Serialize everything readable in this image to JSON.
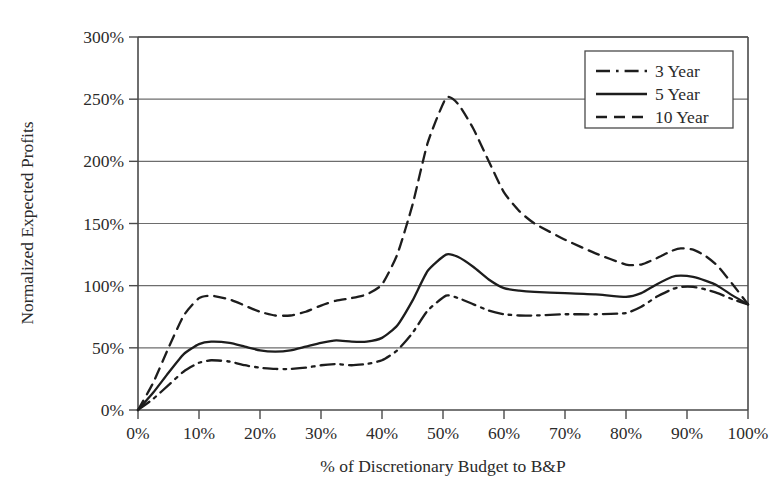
{
  "chart_data": {
    "type": "line",
    "title": "",
    "xlabel": "% of Discretionary Budget to B&P",
    "ylabel": "Normalized Expected Profits",
    "xlim": [
      0,
      100
    ],
    "ylim": [
      0,
      300
    ],
    "grid": true,
    "legend_position": "top-right",
    "x_tick_labels": [
      "0%",
      "10%",
      "20%",
      "30%",
      "40%",
      "50%",
      "60%",
      "70%",
      "80%",
      "90%",
      "100%"
    ],
    "x_tick_values": [
      0,
      10,
      20,
      30,
      40,
      50,
      60,
      70,
      80,
      90,
      100
    ],
    "y_tick_labels": [
      "0%",
      "50%",
      "100%",
      "150%",
      "200%",
      "250%",
      "300%"
    ],
    "y_tick_values": [
      0,
      50,
      100,
      150,
      200,
      250,
      300
    ],
    "x": [
      0,
      2.5,
      5,
      7.5,
      10,
      12,
      15,
      17.5,
      20,
      22.5,
      25,
      27.5,
      30,
      32.5,
      35,
      37.5,
      40,
      42.5,
      45,
      47.5,
      50.5,
      52.5,
      55,
      57.5,
      60,
      62.5,
      65,
      70,
      75,
      80,
      82.5,
      85,
      87.5,
      89,
      91,
      93,
      95,
      97.5,
      100
    ],
    "series": [
      {
        "name": "3 Year",
        "label": "3 Year",
        "line_style": "dash-dot",
        "color": "#1d1d1d",
        "values": [
          0,
          9,
          20,
          31,
          38,
          40,
          39,
          36,
          34,
          33,
          33,
          34,
          36,
          37,
          36,
          37,
          40,
          48,
          62,
          80,
          92,
          90,
          85,
          80,
          77,
          76,
          76,
          77,
          77,
          78,
          83,
          91,
          97,
          99,
          99,
          97,
          94,
          89,
          85
        ]
      },
      {
        "name": "5 Year",
        "label": "5 Year",
        "line_style": "solid",
        "color": "#1d1d1d",
        "values": [
          0,
          14,
          30,
          45,
          53,
          55,
          54,
          51,
          48,
          47,
          48,
          51,
          54,
          56,
          55,
          55,
          58,
          68,
          88,
          112,
          125,
          123,
          115,
          105,
          98,
          96,
          95,
          94,
          93,
          91,
          94,
          101,
          107,
          108,
          107,
          104,
          100,
          92,
          85
        ]
      },
      {
        "name": "10 Year",
        "label": "10 Year",
        "line_style": "dashed",
        "color": "#1d1d1d",
        "values": [
          0,
          22,
          50,
          76,
          90,
          92,
          89,
          84,
          79,
          76,
          76,
          79,
          84,
          88,
          90,
          93,
          101,
          125,
          165,
          215,
          251,
          246,
          226,
          200,
          175,
          160,
          150,
          137,
          126,
          117,
          117,
          122,
          128,
          130,
          129,
          124,
          116,
          101,
          85
        ]
      }
    ]
  }
}
